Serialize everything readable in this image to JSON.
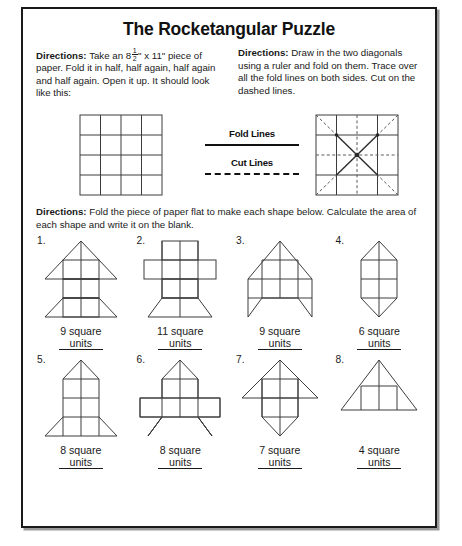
{
  "page": {
    "title": "The Rocketangular Puzzle"
  },
  "directions": {
    "left": {
      "label": "Directions:",
      "text_before_fraction": " Take an 8",
      "fraction_num": "1",
      "fraction_den": "2",
      "text_after_fraction": "\" x 11\" piece of paper. Fold it in half, half again, half again and half again. Open it up. It should look like this:"
    },
    "right": {
      "label": "Directions:",
      "text": " Draw in the two diagonals using a ruler and fold on them. Trace over all the fold lines on both sides. Cut on the dashed lines."
    },
    "bottom": {
      "label": "Directions:",
      "text": " Fold the piece of paper flat to make each shape below. Calculate the area of each shape and write it on the blank."
    }
  },
  "legend": {
    "fold_lines_label": "Fold Lines",
    "cut_lines_label": "Cut Lines"
  },
  "diagrams": {
    "paper_grid": {
      "rows": 4,
      "cols": 4,
      "name": "folded-paper-grid"
    },
    "folded_diagram": {
      "rows": 4,
      "cols": 4,
      "name": "diagonal-fold-diagram"
    }
  },
  "shapes": [
    {
      "number": "1.",
      "answer_value": "9",
      "answer_line1": "9 square",
      "answer_line2": "units",
      "art": "rocket-wide-triangle-nose"
    },
    {
      "number": "2.",
      "answer_value": "11",
      "answer_line1": "11 square",
      "answer_line2": "units",
      "art": "cross-with-flared-base"
    },
    {
      "number": "3.",
      "answer_value": "9",
      "answer_line1": "9 square",
      "answer_line2": "units",
      "art": "rocket-angled-fins"
    },
    {
      "number": "4.",
      "answer_value": "6",
      "answer_line1": "6 square",
      "answer_line2": "units",
      "art": "hexagon-pointed-ends"
    },
    {
      "number": "5.",
      "answer_value": "8",
      "answer_line1": "8 square",
      "answer_line2": "units",
      "art": "narrow-rocket-trapezoid-fins"
    },
    {
      "number": "6.",
      "answer_value": "8",
      "answer_line1": "8 square",
      "answer_line2": "units",
      "art": "rocket-wide-wings-angled-fins"
    },
    {
      "number": "7.",
      "answer_value": "7",
      "answer_line1": "7 square",
      "answer_line2": "units",
      "art": "arrow-triangle-top-point-bottom"
    },
    {
      "number": "8.",
      "answer_value": "4",
      "answer_line1": "4 square",
      "answer_line2": "units",
      "art": "large-triangle"
    }
  ],
  "colors": {
    "ink": "#1a1a1a",
    "line": "#3c3c3c",
    "paper": "#ffffff"
  }
}
